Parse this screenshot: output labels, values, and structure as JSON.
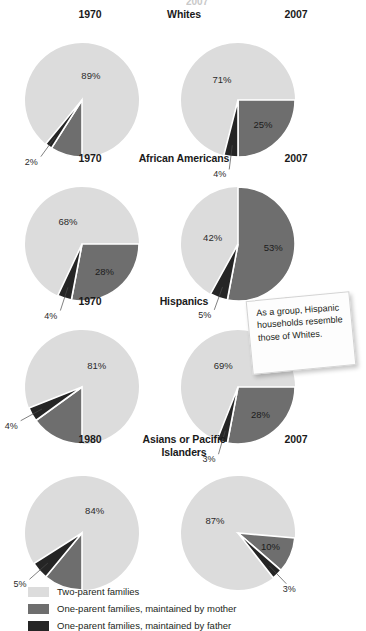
{
  "colors": {
    "two_parent": "#dcdcdc",
    "mother": "#6e6e6e",
    "father": "#252525",
    "separator": "#ffffff",
    "text": "#231f20",
    "note_bg": "#fdfdfd"
  },
  "legend": {
    "items": [
      {
        "label": "Two-parent families",
        "color": "#dcdcdc",
        "key": "two_parent"
      },
      {
        "label": "One-parent families, maintained by mother",
        "color": "#6e6e6e",
        "key": "mother"
      },
      {
        "label": "One-parent families, maintained by father",
        "color": "#252525",
        "key": "father"
      }
    ]
  },
  "note": {
    "text": "As a group, Hispanic households resemble those of Whites."
  },
  "top_clip": {
    "text": "2007"
  },
  "chart_data": {
    "type": "pie",
    "title": "",
    "categories": [
      "Two-parent families",
      "One-parent families, maintained by mother",
      "One-parent families, maintained by father"
    ],
    "unit": "percent",
    "groups": [
      {
        "name": "Whites",
        "charts": [
          {
            "year": "1970",
            "values": [
              89,
              9,
              2
            ],
            "labels": [
              "89%",
              "9%",
              "2%"
            ]
          },
          {
            "year": "2007",
            "values": [
              71,
              25,
              4
            ],
            "labels": [
              "71%",
              "25%",
              "4%"
            ]
          }
        ]
      },
      {
        "name": "African Americans",
        "charts": [
          {
            "year": "1970",
            "values": [
              68,
              28,
              4
            ],
            "labels": [
              "68%",
              "28%",
              "4%"
            ]
          },
          {
            "year": "2007",
            "values": [
              42,
              53,
              5
            ],
            "labels": [
              "42%",
              "53%",
              "5%"
            ]
          }
        ]
      },
      {
        "name": "Hispanics",
        "charts": [
          {
            "year": "1970",
            "values": [
              81,
              15,
              4
            ],
            "labels": [
              "81%",
              "15%",
              "4%"
            ]
          },
          {
            "year": "2007",
            "values": [
              69,
              28,
              3
            ],
            "labels": [
              "69%",
              "28%",
              "3%"
            ]
          }
        ]
      },
      {
        "name": "Asians or Pacific Islanders",
        "charts": [
          {
            "year": "1980",
            "values": [
              84,
              11,
              5
            ],
            "labels": [
              "84%",
              "11%",
              "5%"
            ]
          },
          {
            "year": "2007",
            "values": [
              87,
              10,
              3
            ],
            "labels": [
              "87%",
              "10%",
              "3%"
            ]
          }
        ]
      }
    ]
  }
}
